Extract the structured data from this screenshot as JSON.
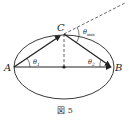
{
  "figure": {
    "caption": "図 5",
    "points": {
      "A": "A",
      "B": "B",
      "C": "C"
    },
    "angles": {
      "theta1": "θ",
      "theta1_sub": "1",
      "theta2": "θ",
      "theta2_sub": "2",
      "theta_min": "θ",
      "theta_min_sub": "min"
    }
  }
}
